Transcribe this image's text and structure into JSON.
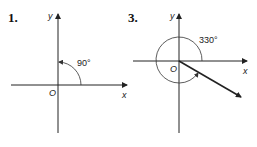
{
  "figures": [
    {
      "number": "1.",
      "x_label": "x",
      "y_label": "y",
      "origin_label": "O",
      "angle_label": "90°",
      "angle_degrees": 90,
      "direction": "counterclockwise"
    },
    {
      "number": "3.",
      "x_label": "x",
      "y_label": "y",
      "origin_label": "O",
      "angle_label": "330°",
      "angle_degrees": 330,
      "direction": "counterclockwise"
    }
  ]
}
